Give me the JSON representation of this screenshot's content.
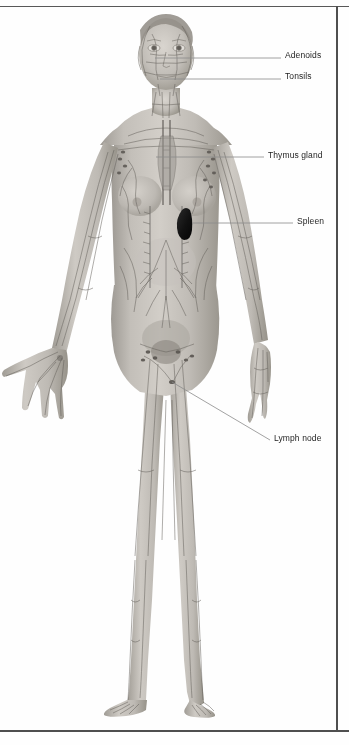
{
  "figure": {
    "frame_color": "#4f4f4f",
    "background_color": "#ffffff",
    "skin_color": "#b8b4ae",
    "vessel_color": "#6f6b66",
    "spleen_color": "#1a1a1a",
    "leader_color": "#8a8a8a",
    "label_color": "#1f1f1f"
  },
  "labels": [
    {
      "id": "adenoids",
      "text": "Adenoids",
      "label_x": 285,
      "label_y": 50,
      "leader_x1": 155,
      "leader_y1": 58,
      "leader_x2": 281,
      "leader_y2": 58,
      "target": "nasopharynx"
    },
    {
      "id": "tonsils",
      "text": "Tonsils",
      "label_x": 285,
      "label_y": 71,
      "leader_x1": 160,
      "leader_y1": 79,
      "leader_x2": 281,
      "leader_y2": 79,
      "target": "throat"
    },
    {
      "id": "thymus-gland",
      "text": "Thymus gland",
      "label_x": 268,
      "label_y": 150,
      "leader_x1": 156,
      "leader_y1": 157,
      "leader_x2": 264,
      "leader_y2": 157,
      "target": "upper-chest"
    },
    {
      "id": "spleen",
      "text": "Spleen",
      "label_x": 297,
      "label_y": 216,
      "leader_x1": 192,
      "leader_y1": 223,
      "leader_x2": 293,
      "leader_y2": 223,
      "target": "left-upper-abdomen"
    },
    {
      "id": "lymph-node",
      "text": "Lymph node",
      "label_x": 274,
      "label_y": 433,
      "leader_x1": 172,
      "leader_y1": 382,
      "leader_x2": 270,
      "leader_y2": 440,
      "target": "inguinal-region"
    }
  ],
  "anatomy": {
    "organs": [
      {
        "name": "adenoids",
        "region": "head"
      },
      {
        "name": "tonsils",
        "region": "head"
      },
      {
        "name": "thymus-gland",
        "region": "chest"
      },
      {
        "name": "spleen",
        "region": "abdomen"
      },
      {
        "name": "lymph-node",
        "region": "groin"
      }
    ],
    "vessel_network": "whole-body lymphatic vessels and nodes"
  }
}
